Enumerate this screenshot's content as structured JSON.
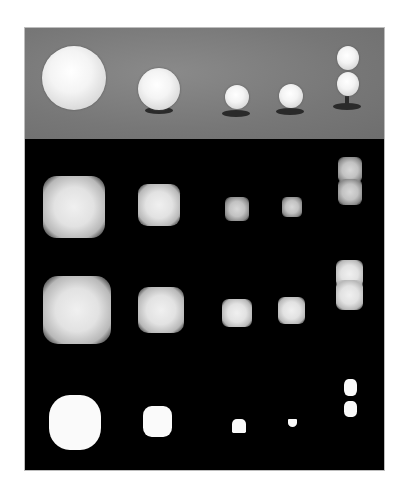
{
  "figure": {
    "rows": [
      {
        "id": "photo",
        "label": "original photograph"
      },
      {
        "id": "blurred",
        "label": "blurred intensity map"
      },
      {
        "id": "smoothed",
        "label": "smoothed intensity map"
      },
      {
        "id": "binary",
        "label": "binary segmentation mask"
      }
    ],
    "objects": [
      {
        "id": "sphere-1",
        "size": "large"
      },
      {
        "id": "sphere-2",
        "size": "medium"
      },
      {
        "id": "sphere-3",
        "size": "small"
      },
      {
        "id": "sphere-4",
        "size": "small"
      },
      {
        "id": "sphere-5",
        "size": "double stacked"
      }
    ],
    "colors": {
      "photo_background": "#777777",
      "mask_background": "#000000",
      "object": "#f5f5f5",
      "stand": "#2a2a2a"
    }
  }
}
